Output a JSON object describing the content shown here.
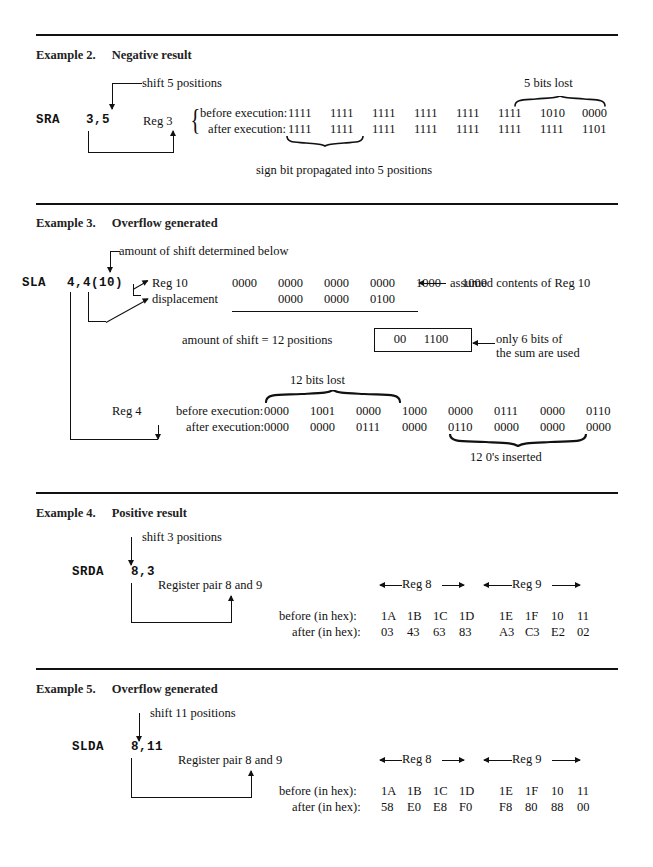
{
  "examples": [
    {
      "id": "example-2",
      "number": "Example 2.",
      "title": "Negative result",
      "mnemonic": "SRA",
      "operands": "3,5",
      "shift_note": "shift 5 positions",
      "bits_lost_note": "5 bits lost",
      "register_label": "Reg 3",
      "before_label": "before execution:",
      "after_label": "after execution:",
      "before_bits": [
        "1111",
        "1111",
        "1111",
        "1111",
        "1111",
        "1111",
        "1010",
        "0000"
      ],
      "after_bits": [
        "1111",
        "1111",
        "1111",
        "1111",
        "1111",
        "1111",
        "1111",
        "1101"
      ],
      "footer_note": "sign bit propagated into 5 positions"
    },
    {
      "id": "example-3",
      "number": "Example 3.",
      "title": "Overflow generated",
      "mnemonic": "SLA",
      "operands": "4,4(10)",
      "shift_note": "amount of shift determined below",
      "reg10_label": "Reg 10",
      "displacement_label": "displacement",
      "reg10_contents": [
        "0000",
        "0000",
        "0000",
        "0000",
        "1000",
        "1000"
      ],
      "reg10_note": "assumed contents of Reg 10",
      "displacement_bits": [
        "0000",
        "0000",
        "0100"
      ],
      "amount_text": "amount of shift = 12 positions",
      "boxed_sum": {
        "high": "00",
        "low": "1100"
      },
      "boxed_note_line1": "only 6 bits of",
      "boxed_note_line2": "the sum are used",
      "bits_lost_note": "12 bits lost",
      "register_label": "Reg 4",
      "before_label": "before execution:",
      "after_label": "after execution:",
      "before_bits": [
        "0000",
        "1001",
        "0000",
        "1000",
        "0000",
        "0111",
        "0000",
        "0110"
      ],
      "after_bits": [
        "0000",
        "0000",
        "0111",
        "0000",
        "0110",
        "0000",
        "0000",
        "0000"
      ],
      "inserted_note": "12 0's inserted"
    },
    {
      "id": "example-4",
      "number": "Example 4.",
      "title": "Positive result",
      "mnemonic": "SRDA",
      "operands": "8,3",
      "shift_note": "shift 3 positions",
      "register_label": "Register pair 8 and 9",
      "reg_high_label": "Reg 8",
      "reg_low_label": "Reg 9",
      "before_label": "before (in hex):",
      "after_label": "after (in hex):",
      "before_hex_high": [
        "1A",
        "1B",
        "1C",
        "1D"
      ],
      "before_hex_low": [
        "1E",
        "1F",
        "10",
        "11"
      ],
      "after_hex_high": [
        "03",
        "43",
        "63",
        "83"
      ],
      "after_hex_low": [
        "A3",
        "C3",
        "E2",
        "02"
      ]
    },
    {
      "id": "example-5",
      "number": "Example 5.",
      "title": "Overflow generated",
      "mnemonic": "SLDA",
      "operands": "8,11",
      "shift_note": "shift 11 positions",
      "register_label": "Register pair 8 and 9",
      "reg_high_label": "Reg 8",
      "reg_low_label": "Reg 9",
      "before_label": "before (in hex):",
      "after_label": "after (in hex):",
      "before_hex_high": [
        "1A",
        "1B",
        "1C",
        "1D"
      ],
      "before_hex_low": [
        "1E",
        "1F",
        "10",
        "11"
      ],
      "after_hex_high": [
        "58",
        "E0",
        "E8",
        "F0"
      ],
      "after_hex_low": [
        "F8",
        "80",
        "88",
        "00"
      ]
    }
  ],
  "colors": {
    "ink": "#111111",
    "paper": "#ffffff"
  }
}
